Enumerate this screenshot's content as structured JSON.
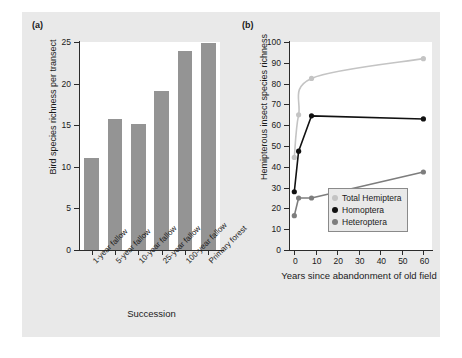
{
  "figure": {
    "background_color": "#e9e9e9",
    "plot_background_color": "#ffffff"
  },
  "panel_a": {
    "label": "(a)",
    "bar_color": "#949494"
  },
  "panel_b": {
    "label": "(b)",
    "series_colors": {
      "total_hemiptera": "#c4c4c4",
      "homoptera": "#111111",
      "heteroptera": "#7d7d7d"
    }
  },
  "chart_data": [
    {
      "type": "bar",
      "panel": "(a)",
      "title": "",
      "xlabel": "Succession",
      "ylabel": "Bird species richness per transect",
      "categories": [
        "1-year fallow",
        "5-year fallow",
        "10-year fallow",
        "25-year fallow",
        "100-year fallow",
        "Primary forest"
      ],
      "values": [
        11.0,
        15.8,
        15.2,
        19.1,
        23.9,
        24.9
      ],
      "ylim": [
        0,
        25
      ],
      "yticks": [
        0,
        5,
        10,
        15,
        20,
        25
      ],
      "ytick_labels": [
        "0",
        "5",
        "10",
        "15",
        "20",
        "25"
      ],
      "grid": false,
      "legend": "none"
    },
    {
      "type": "line",
      "panel": "(b)",
      "title": "",
      "xlabel": "Years since abandonment of old field",
      "ylabel": "Hemipterous insect species richness",
      "xlim": [
        -2,
        64
      ],
      "ylim": [
        0,
        100
      ],
      "xticks": [
        0,
        10,
        20,
        30,
        40,
        50,
        60
      ],
      "xtick_labels": [
        "0",
        "10",
        "20",
        "30",
        "40",
        "50",
        "60"
      ],
      "yticks": [
        0,
        10,
        20,
        30,
        40,
        50,
        60,
        70,
        80,
        90,
        100
      ],
      "ytick_labels": [
        "0",
        "10",
        "20",
        "30",
        "40",
        "50",
        "60",
        "70",
        "80",
        "90",
        "100"
      ],
      "grid": false,
      "legend": "inside-lower-right",
      "series": [
        {
          "name": "Total Hemiptera",
          "color": "#c4c4c4",
          "x": [
            0,
            2,
            8,
            60
          ],
          "values": [
            44.5,
            65.0,
            82.5,
            92.0
          ],
          "smooth": true
        },
        {
          "name": "Homoptera",
          "color": "#111111",
          "x": [
            0,
            2,
            8,
            60
          ],
          "values": [
            28.0,
            47.5,
            64.5,
            63.0
          ],
          "smooth": false
        },
        {
          "name": "Heteroptera",
          "color": "#7d7d7d",
          "x": [
            0,
            2,
            8,
            60
          ],
          "values": [
            16.5,
            25.0,
            25.0,
            37.5
          ],
          "smooth": false
        }
      ]
    }
  ]
}
